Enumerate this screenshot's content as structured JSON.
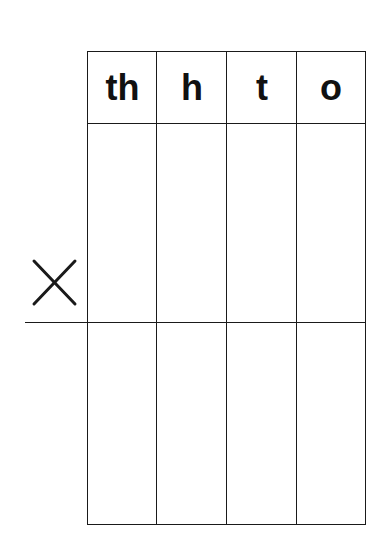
{
  "worksheet": {
    "type": "place-value multiplication grid",
    "columns": [
      {
        "label": "th",
        "meaning": "thousands"
      },
      {
        "label": "h",
        "meaning": "hundreds"
      },
      {
        "label": "t",
        "meaning": "tens"
      },
      {
        "label": "o",
        "meaning": "ones"
      }
    ],
    "operator_icon": "multiply-icon",
    "rows_above_line": 1,
    "rows_below_line": 1,
    "colors": {
      "ink": "#1a1a1a",
      "background": "#ffffff"
    }
  }
}
